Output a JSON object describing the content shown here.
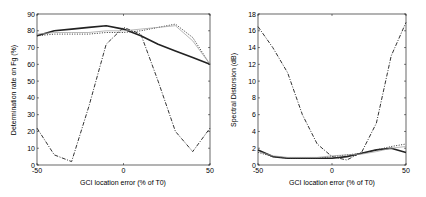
{
  "chart_data": [
    {
      "type": "line",
      "title": "",
      "xlabel": "GCI location error (% of T0)",
      "ylabel": "Determination rate on Fg (%)",
      "xlim": [
        -50,
        50
      ],
      "ylim": [
        0,
        90
      ],
      "xticks": [
        "-50",
        "0",
        "50"
      ],
      "yticks": [
        "0",
        "10",
        "20",
        "30",
        "40",
        "50",
        "60",
        "70",
        "80",
        "90"
      ],
      "grid": false,
      "legend": null,
      "x": [
        -50,
        -40,
        -30,
        -20,
        -10,
        0,
        10,
        20,
        30,
        40,
        50
      ],
      "series": [
        {
          "name": "solid",
          "style": "solid-thick",
          "values": [
            77,
            80,
            81,
            82,
            83,
            81,
            77,
            72,
            68,
            64,
            60
          ]
        },
        {
          "name": "dotted",
          "style": "dotted",
          "values": [
            77,
            78,
            78,
            78,
            79,
            79,
            80,
            82,
            84,
            76,
            60
          ]
        },
        {
          "name": "dashdot",
          "style": "dash-dot",
          "values": [
            22,
            6,
            2,
            35,
            72,
            82,
            78,
            50,
            20,
            8,
            22
          ]
        },
        {
          "name": "thin",
          "style": "thin-gray",
          "values": [
            78,
            79,
            79,
            79,
            80,
            80,
            81,
            82,
            83,
            74,
            60
          ]
        }
      ]
    },
    {
      "type": "line",
      "title": "",
      "xlabel": "GCI location error (% of T0)",
      "ylabel": "Spectral Distorsion (dB)",
      "xlim": [
        -50,
        50
      ],
      "ylim": [
        0,
        18
      ],
      "xticks": [
        "-50",
        "0",
        "50"
      ],
      "yticks": [
        "0",
        "2",
        "4",
        "6",
        "8",
        "10",
        "12",
        "14",
        "16",
        "18"
      ],
      "grid": false,
      "legend": null,
      "x": [
        -50,
        -40,
        -30,
        -20,
        -10,
        0,
        10,
        20,
        30,
        40,
        50
      ],
      "series": [
        {
          "name": "solid",
          "style": "solid-thick",
          "values": [
            1.8,
            1.0,
            0.8,
            0.8,
            0.8,
            0.8,
            1.0,
            1.4,
            1.8,
            2.0,
            1.5
          ]
        },
        {
          "name": "dotted",
          "style": "dotted",
          "values": [
            1.5,
            1.0,
            0.8,
            0.8,
            0.8,
            1.0,
            1.2,
            1.4,
            1.8,
            2.2,
            2.5
          ]
        },
        {
          "name": "dashdot",
          "style": "dash-dot",
          "values": [
            16.5,
            14,
            11,
            6,
            2.5,
            1.0,
            0.6,
            1.5,
            5,
            13,
            17
          ]
        },
        {
          "name": "thin",
          "style": "thin-gray",
          "values": [
            1.6,
            1.1,
            0.9,
            0.9,
            0.9,
            1.1,
            1.2,
            1.3,
            1.6,
            2.0,
            2.2
          ]
        }
      ]
    }
  ],
  "labels": {
    "left_ylabel": "Determination rate on Fg (%)",
    "left_xlabel": "GCI location error (% of T0)",
    "right_ylabel": "Spectral Distorsion (dB)",
    "right_xlabel": "GCI location error (% of T0)"
  }
}
